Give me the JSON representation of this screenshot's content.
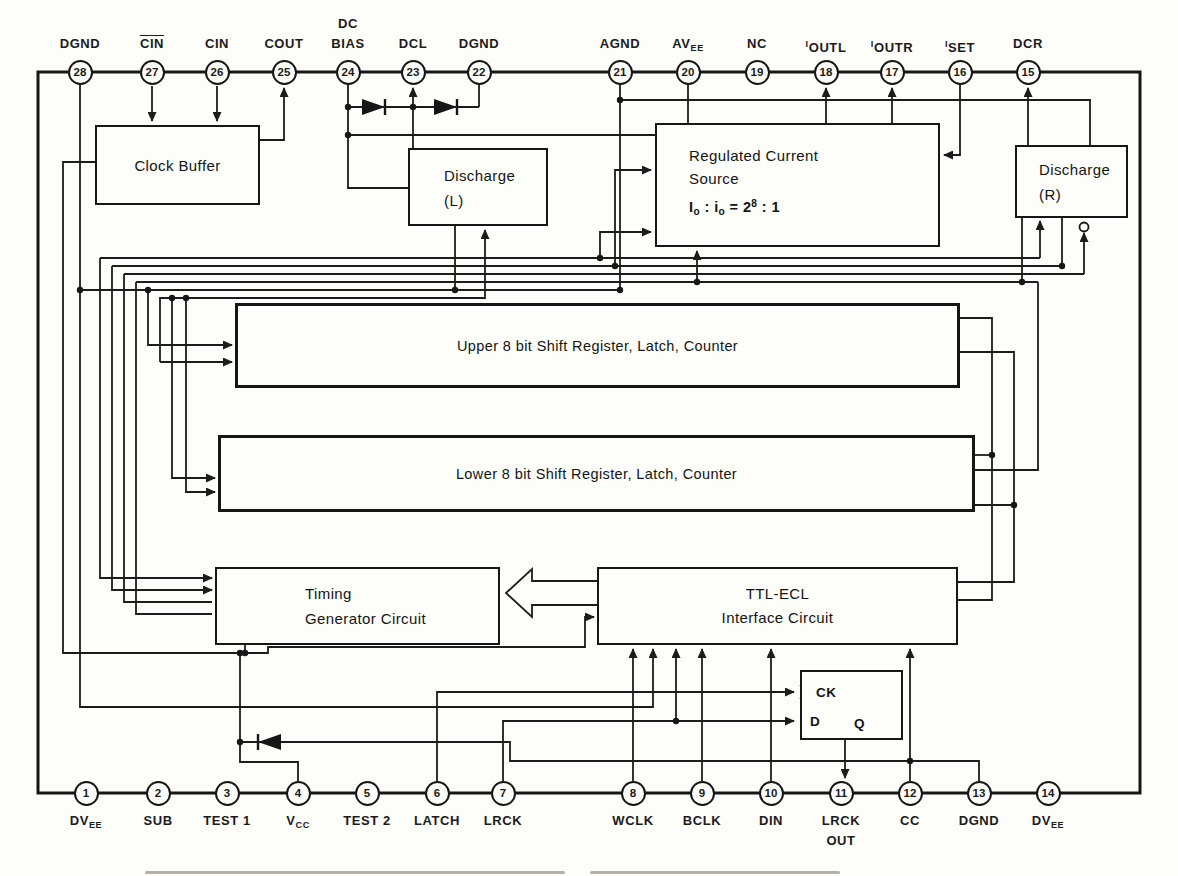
{
  "blocks": {
    "clock_buffer": {
      "label": "Clock Buffer"
    },
    "discharge_l": {
      "line1": "Discharge",
      "line2": "(L)"
    },
    "current_source": {
      "line1": "Regulated Current",
      "line2": "Source",
      "formula": [
        {
          "t": "I"
        },
        {
          "t": "o",
          "style": "sub"
        },
        {
          "t": " : "
        },
        {
          "t": "i"
        },
        {
          "t": "o",
          "style": "sub"
        },
        {
          "t": " = 2"
        },
        {
          "t": "8",
          "style": "sup"
        },
        {
          "t": " : 1"
        }
      ]
    },
    "discharge_r": {
      "line1": "Discharge",
      "line2": "(R)"
    },
    "upper_register": {
      "label": "Upper 8 bit Shift Register, Latch, Counter"
    },
    "lower_register": {
      "label": "Lower 8 bit Shift Register, Latch, Counter"
    },
    "timing_generator": {
      "line1": "Timing",
      "line2": "Generator Circuit"
    },
    "ttl_ecl": {
      "line1": "TTL-ECL",
      "line2": "Interface Circuit"
    },
    "flip_flop": {
      "ck": "CK",
      "d": "D",
      "q": "Q"
    }
  },
  "pins": {
    "top": [
      {
        "number": "28",
        "label": [
          [
            {
              "t": "DGND"
            }
          ]
        ]
      },
      {
        "number": "27",
        "label": [
          [
            {
              "t": "CIN",
              "style": "over"
            }
          ]
        ]
      },
      {
        "number": "26",
        "label": [
          [
            {
              "t": "CIN"
            }
          ]
        ]
      },
      {
        "number": "25",
        "label": [
          [
            {
              "t": "COUT"
            }
          ]
        ]
      },
      {
        "number": "24",
        "label": [
          [
            {
              "t": "DC"
            }
          ],
          [
            {
              "t": "BIAS"
            }
          ]
        ]
      },
      {
        "number": "23",
        "label": [
          [
            {
              "t": "DCL"
            }
          ]
        ]
      },
      {
        "number": "22",
        "label": [
          [
            {
              "t": "DGND"
            }
          ]
        ]
      },
      {
        "number": "21",
        "label": [
          [
            {
              "t": "AGND"
            }
          ]
        ]
      },
      {
        "number": "20",
        "label": [
          [
            {
              "t": "AV"
            },
            {
              "t": "EE",
              "style": "sub"
            }
          ]
        ]
      },
      {
        "number": "19",
        "label": [
          [
            {
              "t": "NC"
            }
          ]
        ]
      },
      {
        "number": "18",
        "label": [
          [
            {
              "t": "I",
              "style": "sup"
            },
            {
              "t": "OUTL"
            }
          ]
        ]
      },
      {
        "number": "17",
        "label": [
          [
            {
              "t": "I",
              "style": "sup"
            },
            {
              "t": "OUTR"
            }
          ]
        ]
      },
      {
        "number": "16",
        "label": [
          [
            {
              "t": "I",
              "style": "sup"
            },
            {
              "t": "SET"
            }
          ]
        ]
      },
      {
        "number": "15",
        "label": [
          [
            {
              "t": "DCR"
            }
          ]
        ]
      }
    ],
    "bottom": [
      {
        "number": "1",
        "label": [
          [
            {
              "t": "DV"
            },
            {
              "t": "EE",
              "style": "sub"
            }
          ]
        ]
      },
      {
        "number": "2",
        "label": [
          [
            {
              "t": "SUB"
            }
          ]
        ]
      },
      {
        "number": "3",
        "label": [
          [
            {
              "t": "TEST 1"
            }
          ]
        ]
      },
      {
        "number": "4",
        "label": [
          [
            {
              "t": "V"
            },
            {
              "t": "CC",
              "style": "sub"
            }
          ]
        ]
      },
      {
        "number": "5",
        "label": [
          [
            {
              "t": "TEST 2"
            }
          ]
        ]
      },
      {
        "number": "6",
        "label": [
          [
            {
              "t": "LATCH"
            }
          ]
        ]
      },
      {
        "number": "7",
        "label": [
          [
            {
              "t": "LRCK"
            }
          ]
        ]
      },
      {
        "number": "8",
        "label": [
          [
            {
              "t": "WCLK"
            }
          ]
        ]
      },
      {
        "number": "9",
        "label": [
          [
            {
              "t": "BCLK"
            }
          ]
        ]
      },
      {
        "number": "10",
        "label": [
          [
            {
              "t": "DIN"
            }
          ]
        ]
      },
      {
        "number": "11",
        "label": [
          [
            {
              "t": "LRCK"
            }
          ],
          [
            {
              "t": "OUT"
            }
          ]
        ]
      },
      {
        "number": "12",
        "label": [
          [
            {
              "t": "CC"
            }
          ]
        ]
      },
      {
        "number": "13",
        "label": [
          [
            {
              "t": "DGND"
            }
          ]
        ]
      },
      {
        "number": "14",
        "label": [
          [
            {
              "t": "DV"
            },
            {
              "t": "EE",
              "style": "sub"
            }
          ]
        ]
      }
    ]
  }
}
